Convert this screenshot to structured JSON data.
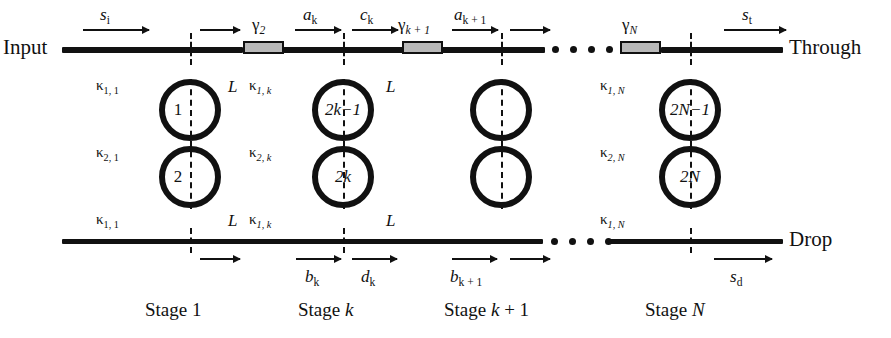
{
  "figure": {
    "type": "schematic-diagram"
  },
  "ports": {
    "input": "Input",
    "through": "Through",
    "drop": "Drop"
  },
  "signals": {
    "s_in": "s",
    "s_in_sub": "i",
    "s_through": "s",
    "s_through_sub": "t",
    "s_drop": "s",
    "s_drop_sub": "d",
    "a_k": "a",
    "a_k_sub": "k",
    "c_k": "c",
    "c_k_sub": "k",
    "a_k1": "a",
    "a_k1_sub": "k + 1",
    "b_k": "b",
    "b_k_sub": "k",
    "d_k": "d",
    "d_k_sub": "k",
    "b_k1": "b",
    "b_k1_sub": "k + 1"
  },
  "couplers": {
    "gamma": "γ",
    "g2_sub": "2",
    "gk1_sub": "k + 1",
    "gN_sub": "N"
  },
  "kappa": {
    "symbol": "κ",
    "stage1_top": "1, 1",
    "stage1_mid": "2, 1",
    "stage1_bot": "1, 1",
    "stagek_top": "1, k",
    "stagek_mid": "2, k",
    "stagek_bot": "1, k",
    "stageN_top": "1, N",
    "stageN_mid": "2, N",
    "stageN_bot": "1, N"
  },
  "lengths": {
    "L": "L"
  },
  "rings": {
    "stage1_top": "1",
    "stage1_bottom": "2",
    "stagek_top": "2k−1",
    "stagek_bottom": "2k",
    "stageN_top": "2N−1",
    "stageN_bottom": "2N"
  },
  "stages": {
    "s1": "Stage 1",
    "sk": "Stage k",
    "sk1": "Stage k + 1",
    "sN": "Stage N"
  },
  "colors": {
    "line": "#111111",
    "coupler_fill": "#b9b9b9",
    "background": "#ffffff"
  }
}
